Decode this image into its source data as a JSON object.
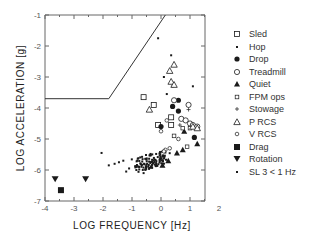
{
  "chart_data": {
    "type": "scatter",
    "title": "",
    "xlabel": "LOG FREQUENCY [Hz]",
    "ylabel": "LOG ACCELERATION [g]",
    "xlim": [
      -4,
      2
    ],
    "ylim": [
      -7,
      -1
    ],
    "x_ticks": [
      "-4",
      "-3",
      "-2",
      "-1",
      "0",
      "1",
      "2"
    ],
    "y_ticks": [
      "-1",
      "-2",
      "-3",
      "-4",
      "-5",
      "-6",
      "-7"
    ],
    "grid": false,
    "legend_position": "right",
    "limit_curve": {
      "name": "requirement boundary",
      "points": [
        [
          -4,
          -3.7
        ],
        [
          -1.8,
          -3.7
        ],
        [
          0.15,
          -1
        ]
      ]
    },
    "series": [
      {
        "name": "Sled",
        "marker": "open-square",
        "points": [
          [
            -0.6,
            -3.65
          ],
          [
            -0.25,
            -3.9
          ],
          [
            0.35,
            -4.3
          ],
          [
            -0.1,
            -4.55
          ],
          [
            0.35,
            -4.55
          ]
        ]
      },
      {
        "name": "Hop",
        "marker": "small-filled-square",
        "points": [
          [
            -0.1,
            -1.75
          ],
          [
            0.35,
            -2.3
          ],
          [
            0.4,
            -3.3
          ],
          [
            0.1,
            -3.0
          ],
          [
            1.1,
            -3.3
          ],
          [
            0.2,
            -3.55
          ]
        ]
      },
      {
        "name": "Drop",
        "marker": "filled-circle",
        "points": [
          [
            0.6,
            -3.75
          ],
          [
            0.4,
            -3.95
          ],
          [
            0.6,
            -4.1
          ],
          [
            0.0,
            -4.6
          ],
          [
            1.15,
            -4.95
          ]
        ]
      },
      {
        "name": "Treadmill",
        "marker": "open-circle",
        "points": [
          [
            0.45,
            -3.75
          ],
          [
            0.95,
            -3.9
          ],
          [
            0.7,
            -4.35
          ],
          [
            0.85,
            -4.4
          ],
          [
            1.0,
            -4.5
          ],
          [
            1.1,
            -4.55
          ],
          [
            1.25,
            -4.6
          ]
        ]
      },
      {
        "name": "Quiet",
        "marker": "filled-triangle",
        "points": [
          [
            0.8,
            -4.75
          ],
          [
            1.25,
            -5.15
          ],
          [
            0.75,
            -5.35
          ],
          [
            0.55,
            -5.45
          ],
          [
            0.05,
            -5.85
          ],
          [
            0.25,
            -5.7
          ]
        ]
      },
      {
        "name": "FPM ops",
        "marker": "small-open-square",
        "points": [
          [
            0.75,
            -4.65
          ],
          [
            1.0,
            -4.65
          ],
          [
            0.45,
            -4.9
          ],
          [
            0.9,
            -5.25
          ]
        ]
      },
      {
        "name": "Stowage",
        "marker": "plus",
        "points": [
          [
            0.95,
            -4.05
          ],
          [
            0.65,
            -4.55
          ]
        ]
      },
      {
        "name": "P RCS",
        "marker": "open-triangle",
        "points": [
          [
            0.45,
            -2.6
          ],
          [
            0.3,
            -2.8
          ],
          [
            0.35,
            -3.15
          ],
          [
            0.45,
            -3.25
          ],
          [
            -0.4,
            -4.05
          ],
          [
            1.1,
            -4.6
          ],
          [
            1.25,
            -4.65
          ]
        ]
      },
      {
        "name": "V RCS",
        "marker": "small-open-circle",
        "points": [
          [
            0.2,
            -4.4
          ],
          [
            0.0,
            -4.75
          ],
          [
            0.6,
            -5.0
          ],
          [
            0.15,
            -5.35
          ],
          [
            0.1,
            -5.4
          ],
          [
            0.3,
            -5.3
          ]
        ]
      },
      {
        "name": "Drag",
        "marker": "filled-square",
        "points": [
          [
            -3.45,
            -6.65
          ]
        ]
      },
      {
        "name": "Rotation",
        "marker": "filled-inverted-triangle",
        "points": [
          [
            -3.65,
            -6.3
          ],
          [
            -2.6,
            -6.3
          ]
        ]
      },
      {
        "name": "SL 3 < 1 Hz",
        "marker": "dot",
        "points": "dense cluster of ~120 points spanning x -2.0 to 0.3, y -5.35 to -6.2, concentrated around x -0.5..0.1, y -5.5..-5.9"
      }
    ]
  },
  "legend": {
    "items": [
      {
        "label": "Sled",
        "marker": "open-square"
      },
      {
        "label": "Hop",
        "marker": "small-filled-square"
      },
      {
        "label": "Drop",
        "marker": "filled-circle"
      },
      {
        "label": "Treadmill",
        "marker": "open-circle"
      },
      {
        "label": "Quiet",
        "marker": "filled-triangle"
      },
      {
        "label": "FPM ops",
        "marker": "small-open-square"
      },
      {
        "label": "Stowage",
        "marker": "plus"
      },
      {
        "label": "P RCS",
        "marker": "open-triangle"
      },
      {
        "label": "V RCS",
        "marker": "small-open-circle"
      },
      {
        "label": "Drag",
        "marker": "filled-square"
      },
      {
        "label": "Rotation",
        "marker": "filled-inverted-triangle"
      },
      {
        "label": "SL 3 < 1 Hz",
        "marker": "dot"
      }
    ]
  },
  "axes": {
    "xlabel": "LOG FREQUENCY [Hz]",
    "ylabel": "LOG ACCELERATION [g]"
  },
  "colors": {
    "ink": "#1a1a1a",
    "axis": "#666666"
  }
}
